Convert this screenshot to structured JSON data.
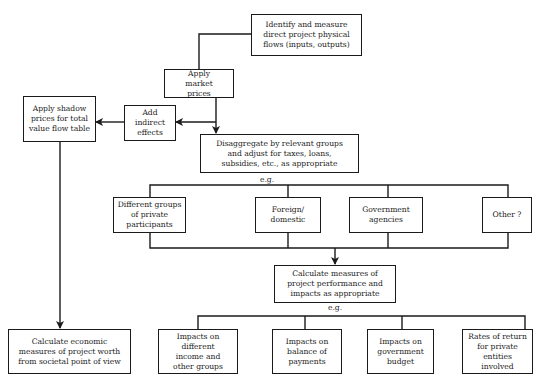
{
  "diagram": {
    "nodes": {
      "identify": "Identify and measure direct project physical flows (inputs, outputs)",
      "market": "Apply market prices",
      "indirect": "Add indirect effects",
      "shadow": "Apply shadow prices for total value flow table",
      "disaggregate": "Disaggregate by relevant groups and adjust for taxes, loans, subsidies, etc., as appropriate",
      "groups": [
        "Different groups of private participants",
        "Foreign/ domestic",
        "Government agencies",
        "Other ?"
      ],
      "calc_performance": "Calculate measures of project performance and impacts as appropriate",
      "impacts": [
        "Impacts on different income and other groups",
        "Impacts on balance of payments",
        "Impacts on government budget",
        "Rates of return for private entities involved"
      ],
      "calc_economic": "Calculate economic measures of project worth from societal point of view"
    },
    "eg_label_1": "e.g.",
    "eg_label_2": "e.g.",
    "line_color": "#1a1a1a"
  }
}
